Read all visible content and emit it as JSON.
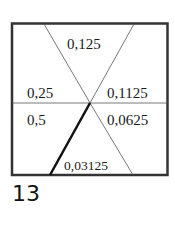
{
  "diagram": {
    "type": "square-divided-into-sectors",
    "sectors": [
      {
        "id": "top",
        "label": "0,125"
      },
      {
        "id": "upper-left",
        "label": "0,25"
      },
      {
        "id": "upper-right",
        "label": "0,1125"
      },
      {
        "id": "lower-left",
        "label": "0,5"
      },
      {
        "id": "lower-right",
        "label": "0,0625"
      },
      {
        "id": "bottom",
        "label": "0,03125"
      }
    ],
    "highlighted_line": "center to bottom-left",
    "figure_number": "13"
  },
  "colors": {
    "border": "#333333",
    "thin_line": "#555555",
    "thick_line": "#111111",
    "text": "#1a1a1a"
  }
}
